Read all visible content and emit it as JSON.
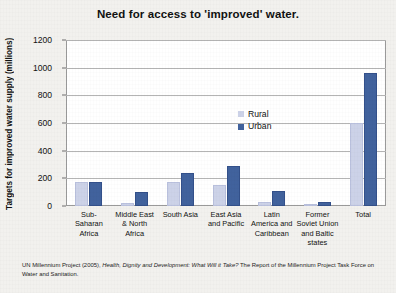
{
  "chart_data": {
    "type": "bar",
    "title": "Need for access to 'improved' water.",
    "xlabel": "",
    "ylabel": "Targets for improved water supply (millions)",
    "ylim": [
      0,
      1200
    ],
    "yticks": [
      0,
      200,
      400,
      600,
      800,
      1000,
      1200
    ],
    "grid": true,
    "legend_position": "inside-upper-right",
    "categories": [
      "Sub-Saharan Africa",
      "Middle East & North Africa",
      "South Asia",
      "East Asia and Pacific",
      "Latin America and Caribbean",
      "Former Soviet Union and Baltic states",
      "Total"
    ],
    "category_lines": [
      [
        "Sub-",
        "Saharan",
        "Africa"
      ],
      [
        "Middle East",
        "& North",
        "Africa"
      ],
      [
        "South Asia"
      ],
      [
        "East Asia",
        "and Pacific"
      ],
      [
        "Latin",
        "America and",
        "Caribbean"
      ],
      [
        "Former",
        "Soviet Union",
        "and Baltic",
        "states"
      ],
      [
        "Total"
      ]
    ],
    "series": [
      {
        "name": "Rural",
        "color": "#ccd2e8",
        "values": [
          170,
          20,
          175,
          150,
          30,
          5,
          600
        ]
      },
      {
        "name": "Urban",
        "color": "#41629d",
        "values": [
          175,
          100,
          240,
          290,
          110,
          30,
          960
        ]
      }
    ]
  },
  "source": {
    "text": "UN Millennium Project (2005), Health, Dignity and Development: What Will it Take? The Report of the Millennium Project Task Force on Water and Sanitation.",
    "italic_part": "Health, Dignity and Development: What Will it Take?"
  }
}
